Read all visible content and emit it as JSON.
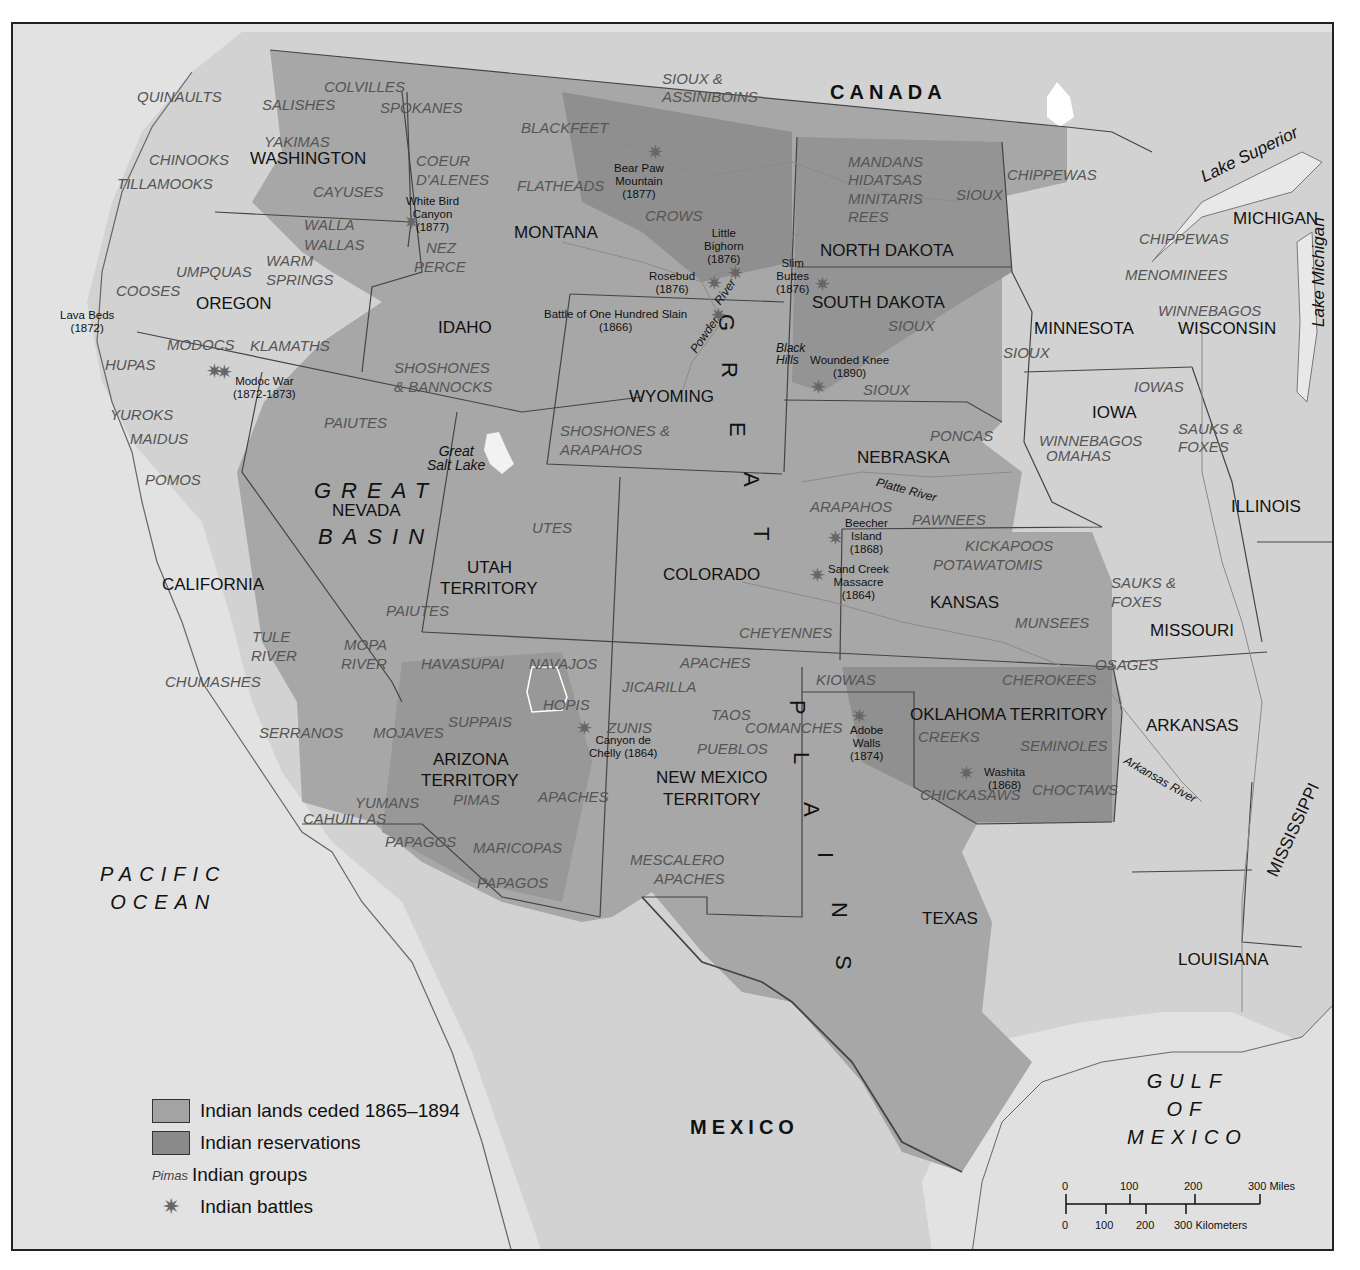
{
  "map": {
    "title": "Indian Lands, Battles and Reservations in the American West, 1865–1894",
    "countries": [
      {
        "name": "CANADA",
        "x": 828,
        "y": 80
      },
      {
        "name": "MEXICO",
        "x": 688,
        "y": 1115
      }
    ],
    "oceans": [
      {
        "name": "PACIFIC\nOCEAN",
        "x": 98,
        "y": 858
      },
      {
        "name": "GULF\nOF\nMEXICO",
        "x": 1125,
        "y": 1065
      }
    ],
    "regions": [
      {
        "name": "GREAT",
        "x": 312,
        "y": 478
      },
      {
        "name": "BASIN",
        "x": 316,
        "y": 524
      }
    ],
    "great_plains_letters": [
      {
        "letter": "G",
        "x": 735,
        "y": 312
      },
      {
        "letter": "R",
        "x": 738,
        "y": 360
      },
      {
        "letter": "E",
        "x": 746,
        "y": 420
      },
      {
        "letter": "A",
        "x": 760,
        "y": 470
      },
      {
        "letter": "T",
        "x": 770,
        "y": 525
      },
      {
        "letter": "P",
        "x": 806,
        "y": 698
      },
      {
        "letter": "L",
        "x": 810,
        "y": 750
      },
      {
        "letter": "A",
        "x": 820,
        "y": 800
      },
      {
        "letter": "I",
        "x": 834,
        "y": 850
      },
      {
        "letter": "N",
        "x": 848,
        "y": 900
      },
      {
        "letter": "S",
        "x": 852,
        "y": 953
      }
    ],
    "states": [
      {
        "name": "WASHINGTON",
        "x": 248,
        "y": 148
      },
      {
        "name": "OREGON",
        "x": 194,
        "y": 293
      },
      {
        "name": "IDAHO",
        "x": 436,
        "y": 317
      },
      {
        "name": "MONTANA",
        "x": 512,
        "y": 222
      },
      {
        "name": "WYOMING",
        "x": 627,
        "y": 386
      },
      {
        "name": "NORTH DAKOTA",
        "x": 818,
        "y": 240
      },
      {
        "name": "SOUTH DAKOTA",
        "x": 810,
        "y": 292
      },
      {
        "name": "MINNESOTA",
        "x": 1032,
        "y": 318
      },
      {
        "name": "WISCONSIN",
        "x": 1176,
        "y": 318
      },
      {
        "name": "MICHIGAN",
        "x": 1231,
        "y": 208
      },
      {
        "name": "IOWA",
        "x": 1090,
        "y": 402
      },
      {
        "name": "NEBRASKA",
        "x": 855,
        "y": 447
      },
      {
        "name": "ILLINOIS",
        "x": 1229,
        "y": 496
      },
      {
        "name": "NEVADA",
        "x": 330,
        "y": 500
      },
      {
        "name": "UTAH",
        "x": 465,
        "y": 557
      },
      {
        "name": "TERRITORY",
        "x": 438,
        "y": 578
      },
      {
        "name": "CALIFORNIA",
        "x": 160,
        "y": 574
      },
      {
        "name": "COLORADO",
        "x": 661,
        "y": 564
      },
      {
        "name": "KANSAS",
        "x": 928,
        "y": 592
      },
      {
        "name": "MISSOURI",
        "x": 1148,
        "y": 620
      },
      {
        "name": "OKLAHOMA TERRITORY",
        "x": 908,
        "y": 704
      },
      {
        "name": "ARKANSAS",
        "x": 1144,
        "y": 715
      },
      {
        "name": "ARIZONA",
        "x": 431,
        "y": 749
      },
      {
        "name": "TERRITORY",
        "x": 419,
        "y": 770
      },
      {
        "name": "NEW MEXICO",
        "x": 654,
        "y": 767
      },
      {
        "name": "TERRITORY",
        "x": 661,
        "y": 789
      },
      {
        "name": "TEXAS",
        "x": 920,
        "y": 908
      },
      {
        "name": "LOUISIANA",
        "x": 1176,
        "y": 949
      }
    ],
    "mississippi": {
      "name": "MISSISSIPPI",
      "x": 1262,
      "y": 870
    },
    "lakes": [
      {
        "name": "Lake Superior",
        "x": 1196,
        "y": 168,
        "rotate": -26
      },
      {
        "name": "Lake Michigan",
        "x": 1308,
        "y": 325,
        "rotate": -90
      },
      {
        "name": "Great\nSalt Lake",
        "x": 425,
        "y": 442,
        "rotate": 0
      }
    ],
    "rivers": [
      {
        "name": "Platte River",
        "x": 876,
        "y": 474,
        "rotate": 15
      },
      {
        "name": "Arkansas River",
        "x": 1126,
        "y": 752,
        "rotate": 30
      },
      {
        "name": "Powder",
        "x": 686,
        "y": 346,
        "rotate": -55
      },
      {
        "name": "River",
        "x": 710,
        "y": 298,
        "rotate": -55
      },
      {
        "name": "Black\nHills",
        "x": 774,
        "y": 340,
        "rotate": 0
      }
    ],
    "tribes": [
      {
        "name": "QUINAULTS",
        "x": 135,
        "y": 87
      },
      {
        "name": "SALISHES",
        "x": 260,
        "y": 95
      },
      {
        "name": "COLVILLES",
        "x": 322,
        "y": 77
      },
      {
        "name": "SPOKANES",
        "x": 378,
        "y": 98
      },
      {
        "name": "SIOUX &",
        "x": 660,
        "y": 69
      },
      {
        "name": "ASSINIBOINS",
        "x": 660,
        "y": 87
      },
      {
        "name": "YAKIMAS",
        "x": 262,
        "y": 132
      },
      {
        "name": "CHINOOKS",
        "x": 147,
        "y": 150
      },
      {
        "name": "TILLAMOOKS",
        "x": 115,
        "y": 174
      },
      {
        "name": "CAYUSES",
        "x": 311,
        "y": 182
      },
      {
        "name": "COEUR",
        "x": 414,
        "y": 151
      },
      {
        "name": "D'ALENES",
        "x": 414,
        "y": 170
      },
      {
        "name": "BLACKFEET",
        "x": 519,
        "y": 118
      },
      {
        "name": "FLATHEADS",
        "x": 515,
        "y": 176
      },
      {
        "name": "CROWS",
        "x": 643,
        "y": 206
      },
      {
        "name": "WALLA",
        "x": 302,
        "y": 215
      },
      {
        "name": "WALLAS",
        "x": 302,
        "y": 235
      },
      {
        "name": "NEZ",
        "x": 424,
        "y": 238
      },
      {
        "name": "PERCE",
        "x": 412,
        "y": 257
      },
      {
        "name": "WARM",
        "x": 264,
        "y": 251
      },
      {
        "name": "SPRINGS",
        "x": 264,
        "y": 270
      },
      {
        "name": "UMPQUAS",
        "x": 174,
        "y": 262
      },
      {
        "name": "COOSES",
        "x": 114,
        "y": 281
      },
      {
        "name": "MODOCS",
        "x": 165,
        "y": 335
      },
      {
        "name": "KLAMATHS",
        "x": 248,
        "y": 336
      },
      {
        "name": "HUPAS",
        "x": 103,
        "y": 355
      },
      {
        "name": "SHOSHONES",
        "x": 392,
        "y": 358
      },
      {
        "name": "& BANNOCKS",
        "x": 392,
        "y": 377
      },
      {
        "name": "MANDANS",
        "x": 846,
        "y": 152
      },
      {
        "name": "HIDATSAS",
        "x": 846,
        "y": 170
      },
      {
        "name": "MINITARIS",
        "x": 846,
        "y": 189
      },
      {
        "name": "REES",
        "x": 846,
        "y": 207
      },
      {
        "name": "SIOUX",
        "x": 954,
        "y": 185
      },
      {
        "name": "CHIPPEWAS",
        "x": 1005,
        "y": 165
      },
      {
        "name": "CHIPPEWAS",
        "x": 1137,
        "y": 229
      },
      {
        "name": "MENOMINEES",
        "x": 1123,
        "y": 265
      },
      {
        "name": "WINNEBAGOS",
        "x": 1156,
        "y": 301
      },
      {
        "name": "SIOUX",
        "x": 886,
        "y": 316
      },
      {
        "name": "SIOUX",
        "x": 1001,
        "y": 343
      },
      {
        "name": "SIOUX",
        "x": 861,
        "y": 380
      },
      {
        "name": "IOWAS",
        "x": 1132,
        "y": 377
      },
      {
        "name": "YUROKS",
        "x": 108,
        "y": 405
      },
      {
        "name": "MAIDUS",
        "x": 128,
        "y": 429
      },
      {
        "name": "POMOS",
        "x": 143,
        "y": 470
      },
      {
        "name": "PAIUTES",
        "x": 322,
        "y": 413
      },
      {
        "name": "SHOSHONES &",
        "x": 558,
        "y": 421
      },
      {
        "name": "ARAPAHOS",
        "x": 558,
        "y": 440
      },
      {
        "name": "PONCAS",
        "x": 928,
        "y": 426
      },
      {
        "name": "WINNEBAGOS",
        "x": 1037,
        "y": 431
      },
      {
        "name": "OMAHAS",
        "x": 1044,
        "y": 446
      },
      {
        "name": "SAUKS &",
        "x": 1176,
        "y": 419
      },
      {
        "name": "FOXES",
        "x": 1176,
        "y": 437
      },
      {
        "name": "UTES",
        "x": 530,
        "y": 518
      },
      {
        "name": "ARAPAHOS",
        "x": 808,
        "y": 497
      },
      {
        "name": "PAWNEES",
        "x": 910,
        "y": 510
      },
      {
        "name": "KICKAPOOS",
        "x": 963,
        "y": 536
      },
      {
        "name": "POTAWATOMIS",
        "x": 931,
        "y": 555
      },
      {
        "name": "PAIUTES",
        "x": 384,
        "y": 601
      },
      {
        "name": "SAUKS &",
        "x": 1109,
        "y": 573
      },
      {
        "name": "FOXES",
        "x": 1109,
        "y": 592
      },
      {
        "name": "MUNSEES",
        "x": 1013,
        "y": 613
      },
      {
        "name": "CHEYENNES",
        "x": 737,
        "y": 623
      },
      {
        "name": "TULE",
        "x": 250,
        "y": 627
      },
      {
        "name": "RIVER",
        "x": 249,
        "y": 646
      },
      {
        "name": "MOPA",
        "x": 342,
        "y": 635
      },
      {
        "name": "RIVER",
        "x": 339,
        "y": 654
      },
      {
        "name": "HAVASUPAI",
        "x": 419,
        "y": 654
      },
      {
        "name": "NAVAJOS",
        "x": 527,
        "y": 654
      },
      {
        "name": "APACHES",
        "x": 678,
        "y": 653
      },
      {
        "name": "OSAGES",
        "x": 1093,
        "y": 655
      },
      {
        "name": "CHUMASHES",
        "x": 163,
        "y": 672
      },
      {
        "name": "KIOWAS",
        "x": 814,
        "y": 670
      },
      {
        "name": "CHEROKEES",
        "x": 1000,
        "y": 670
      },
      {
        "name": "HOPIS",
        "x": 541,
        "y": 695
      },
      {
        "name": "JICARILLA",
        "x": 620,
        "y": 677
      },
      {
        "name": "SERRANOS",
        "x": 257,
        "y": 723
      },
      {
        "name": "MOJAVES",
        "x": 371,
        "y": 723
      },
      {
        "name": "SUPPAIS",
        "x": 446,
        "y": 712
      },
      {
        "name": "ZUNIS",
        "x": 605,
        "y": 718
      },
      {
        "name": "TAOS",
        "x": 709,
        "y": 705
      },
      {
        "name": "COMANCHES",
        "x": 743,
        "y": 718
      },
      {
        "name": "CREEKS",
        "x": 916,
        "y": 727
      },
      {
        "name": "SEMINOLES",
        "x": 1018,
        "y": 736
      },
      {
        "name": "PUEBLOS",
        "x": 695,
        "y": 739
      },
      {
        "name": "CHICKASAWS",
        "x": 918,
        "y": 785
      },
      {
        "name": "CHOCTAWS",
        "x": 1030,
        "y": 780
      },
      {
        "name": "YUMANS",
        "x": 353,
        "y": 793
      },
      {
        "name": "PIMAS",
        "x": 451,
        "y": 790
      },
      {
        "name": "APACHES",
        "x": 536,
        "y": 787
      },
      {
        "name": "CAHUILLAS",
        "x": 301,
        "y": 809
      },
      {
        "name": "PAPAGOS",
        "x": 383,
        "y": 832
      },
      {
        "name": "MARICOPAS",
        "x": 471,
        "y": 838
      },
      {
        "name": "MESCALERO",
        "x": 628,
        "y": 850
      },
      {
        "name": "APACHES",
        "x": 652,
        "y": 869
      },
      {
        "name": "PAPAGOS",
        "x": 475,
        "y": 873
      }
    ],
    "battles": [
      {
        "label": "White Bird\nCanyon\n(1877)",
        "star_x": 409,
        "star_y": 220,
        "x": 404,
        "y": 193
      },
      {
        "label": "Bear Paw\nMountain\n(1877)",
        "star_x": 653,
        "star_y": 150,
        "x": 612,
        "y": 160
      },
      {
        "label": "Little\nBighorn\n(1876)",
        "star_x": 733,
        "star_y": 271,
        "x": 702,
        "y": 225
      },
      {
        "label": "Rosebud\n(1876)",
        "star_x": 712,
        "star_y": 281,
        "x": 647,
        "y": 268
      },
      {
        "label": "Slim\nButtes\n(1876)",
        "star_x": 820,
        "star_y": 282,
        "x": 774,
        "y": 255
      },
      {
        "label": "Battle of One Hundred Slain\n(1866)",
        "star_x": 716,
        "star_y": 313,
        "x": 542,
        "y": 306
      },
      {
        "label": "Wounded Knee\n(1890)",
        "star_x": 816,
        "star_y": 385,
        "x": 808,
        "y": 352
      },
      {
        "label": "Lava Beds\n(1872)",
        "star_x": 212,
        "star_y": 369,
        "x": 58,
        "y": 307
      },
      {
        "label": "Modoc War\n(1872-1873)",
        "star_x": 222,
        "star_y": 370,
        "x": 231,
        "y": 373
      },
      {
        "label": "Beecher\nIsland\n(1868)",
        "star_x": 833,
        "star_y": 536,
        "x": 843,
        "y": 515
      },
      {
        "label": "Sand Creek\nMassacre\n(1864)",
        "star_x": 815,
        "star_y": 573,
        "x": 826,
        "y": 561
      },
      {
        "label": "Canyon de\nChelly (1864)",
        "star_x": 582,
        "star_y": 726,
        "x": 587,
        "y": 732
      },
      {
        "label": "Adobe\nWalls\n(1874)",
        "star_x": 857,
        "star_y": 714,
        "x": 848,
        "y": 722
      },
      {
        "label": "Washita\n(1868)",
        "star_x": 964,
        "star_y": 771,
        "x": 982,
        "y": 764
      }
    ]
  },
  "legend": {
    "items": [
      {
        "type": "swatch",
        "color": "#a3a3a3",
        "label": "Indian lands ceded 1865–1894"
      },
      {
        "type": "swatch",
        "color": "#8a8a8a",
        "label": "Indian reservations"
      },
      {
        "type": "sample",
        "sample": "Pimas",
        "label": "Indian groups"
      },
      {
        "type": "star",
        "icon": "battle-star-icon",
        "label": "Indian battles"
      }
    ]
  },
  "scale_bar": {
    "miles": [
      "0",
      "100",
      "200",
      "300 Miles"
    ],
    "kilometers": [
      "0",
      "100",
      "200",
      "300 Kilometers"
    ]
  },
  "colors": {
    "background_land": "#d6d6d6",
    "ceded_land": "#a3a3a3",
    "reservation": "#8a8a8a",
    "water": "#e4e4e4",
    "border": "#333333",
    "battle_star": "#666666"
  }
}
